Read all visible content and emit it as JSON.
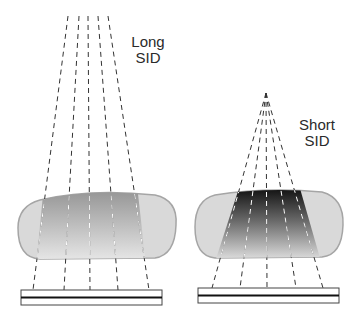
{
  "panels": [
    {
      "id": "long",
      "label_line1": "Long",
      "label_line2": "SID",
      "label_pos": {
        "x": 128,
        "y": 35
      }
    },
    {
      "id": "short",
      "label_line1": "Short",
      "label_line2": "SID",
      "label_pos": {
        "x": 296,
        "y": 118
      }
    }
  ],
  "colors": {
    "body_fill": "#d9d9d9",
    "body_stroke": "#9a9a9a",
    "beam_dark_long": "#8f8f8f",
    "beam_dark_short": "#0a0a0a",
    "beam_light": "#e6e6e6",
    "film_stroke": "#444444",
    "film_center": "#111111"
  }
}
